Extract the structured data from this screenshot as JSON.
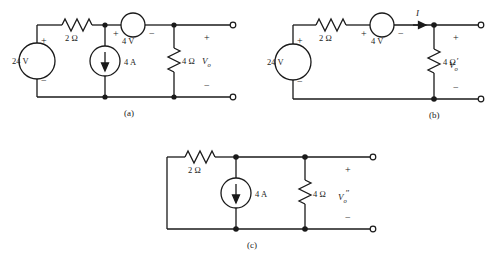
{
  "figure": {
    "type": "circuit-diagram-set",
    "background": "#ffffff",
    "ink_color": "#1a1a1a",
    "panel_count": 3
  },
  "panels": [
    {
      "id": "a",
      "caption": "(a)",
      "output_label": "V",
      "output_sub": "o",
      "output_prime": "",
      "plus_sign": "+",
      "minus_sign": "−",
      "components": {
        "voltage_source": {
          "value": "24 V",
          "plus": "+",
          "minus": "−",
          "orientation": "vertical-left"
        },
        "resistor_series": {
          "value": "2 Ω"
        },
        "current_source": {
          "value": "4 A",
          "direction": "down"
        },
        "voltage_source_series": {
          "value": "4 V",
          "plus": "+",
          "minus": "−",
          "orientation": "horizontal-top"
        },
        "resistor_load": {
          "value": "4 Ω"
        }
      }
    },
    {
      "id": "b",
      "caption": "(b)",
      "output_label": "V",
      "output_sub": "o",
      "output_prime": "′",
      "plus_sign": "+",
      "minus_sign": "−",
      "current_label": "I",
      "components": {
        "voltage_source": {
          "value": "24 V",
          "plus": "+",
          "minus": "−",
          "orientation": "vertical-left"
        },
        "resistor_series": {
          "value": "2 Ω"
        },
        "voltage_source_series": {
          "value": "4 V",
          "plus": "+",
          "minus": "−",
          "orientation": "horizontal-top"
        },
        "resistor_load": {
          "value": "4 Ω"
        }
      }
    },
    {
      "id": "c",
      "caption": "(c)",
      "output_label": "V",
      "output_sub": "o",
      "output_prime": "″",
      "plus_sign": "+",
      "minus_sign": "−",
      "components": {
        "resistor_series": {
          "value": "2 Ω"
        },
        "current_source": {
          "value": "4 A",
          "direction": "down"
        },
        "resistor_load": {
          "value": "4 Ω"
        }
      }
    }
  ]
}
